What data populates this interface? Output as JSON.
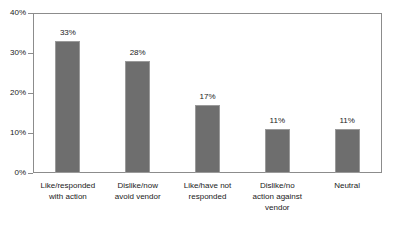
{
  "chart_data": {
    "type": "bar",
    "title": "",
    "subtitle": "",
    "xlabel": "",
    "ylabel": "",
    "categories": [
      "Like/responded with action",
      "Dislike/now avoid vendor",
      "Like/have not responded",
      "Dislike/no action against vendor",
      "Neutral"
    ],
    "category_lines": [
      [
        "Like/responded",
        "with action"
      ],
      [
        "Dislike/now",
        "avoid vendor"
      ],
      [
        "Like/have not",
        "responded"
      ],
      [
        "Dislike/no",
        "action against",
        "vendor"
      ],
      [
        "Neutral"
      ]
    ],
    "values": [
      33,
      28,
      17,
      11,
      11
    ],
    "data_labels": [
      "33%",
      "28%",
      "17%",
      "11%",
      "11%"
    ],
    "ylim": [
      0,
      40
    ],
    "ytick_values": [
      0,
      10,
      20,
      30,
      40
    ],
    "ytick_labels": [
      "0%",
      "10%",
      "20%",
      "30%",
      "40%"
    ],
    "grid": false,
    "legend": false,
    "bar_color": "#6e6e6e",
    "bar_border_color": "#9a9a9a",
    "frame_color": "#8c8c8c",
    "background": "#ffffff"
  }
}
